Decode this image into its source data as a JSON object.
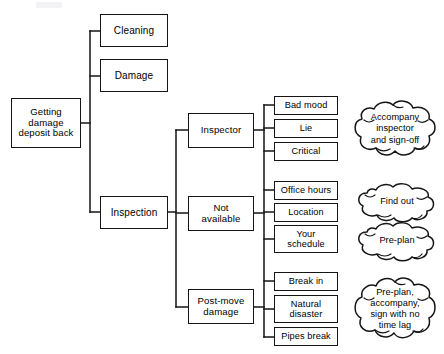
{
  "diagram": {
    "type": "tree-diagram",
    "title_visible": false,
    "background_color": "#ffffff",
    "line_color": "#151515",
    "text_color": "#000000",
    "root": {
      "label": "Getting\ndamage\ndeposit back",
      "x": 11,
      "y": 98,
      "w": 70,
      "h": 50,
      "font_size": 9.6
    },
    "level1": [
      {
        "label": "Cleaning",
        "x": 100,
        "y": 14,
        "w": 68,
        "h": 33,
        "font_size": 10
      },
      {
        "label": "Damage",
        "x": 100,
        "y": 59,
        "w": 68,
        "h": 33,
        "font_size": 10
      },
      {
        "label": "Inspection",
        "x": 100,
        "y": 196,
        "w": 68,
        "h": 33,
        "font_size": 10
      }
    ],
    "level2": [
      {
        "label": "Inspector",
        "x": 188,
        "y": 113,
        "w": 66,
        "h": 35,
        "font_size": 9.6
      },
      {
        "label": "Not\navailable",
        "x": 188,
        "y": 196,
        "w": 66,
        "h": 35,
        "font_size": 9.6
      },
      {
        "label": "Post-move\ndamage",
        "x": 188,
        "y": 289,
        "w": 66,
        "h": 35,
        "font_size": 9.6
      }
    ],
    "level3": [
      {
        "label": "Bad mood",
        "x": 274,
        "y": 96,
        "w": 64,
        "h": 19,
        "font_size": 9.2,
        "group": "inspector"
      },
      {
        "label": "Lie",
        "x": 274,
        "y": 119,
        "w": 64,
        "h": 19,
        "font_size": 9.2,
        "group": "inspector"
      },
      {
        "label": "Critical",
        "x": 274,
        "y": 142,
        "w": 64,
        "h": 19,
        "font_size": 9.2,
        "group": "inspector"
      },
      {
        "label": "Office hours",
        "x": 274,
        "y": 181,
        "w": 64,
        "h": 19,
        "font_size": 9.2,
        "group": "not-available"
      },
      {
        "label": "Location",
        "x": 274,
        "y": 203,
        "w": 64,
        "h": 19,
        "font_size": 9.2,
        "group": "not-available"
      },
      {
        "label": "Your\nschedule",
        "x": 274,
        "y": 225,
        "w": 64,
        "h": 28,
        "font_size": 9.2,
        "group": "not-available"
      },
      {
        "label": "Break in",
        "x": 274,
        "y": 272,
        "w": 64,
        "h": 19,
        "font_size": 9.2,
        "group": "post-move"
      },
      {
        "label": "Natural\ndisaster",
        "x": 274,
        "y": 295,
        "w": 64,
        "h": 28,
        "font_size": 9.2,
        "group": "post-move"
      },
      {
        "label": "Pipes break",
        "x": 274,
        "y": 327,
        "w": 64,
        "h": 19,
        "font_size": 9.2,
        "group": "post-move"
      }
    ],
    "clouds": [
      {
        "label": "Accompany\ninspector\nand sign-off",
        "x": 352,
        "y": 100,
        "w": 86,
        "h": 58,
        "font_size": 9.2,
        "relates_to": "inspector"
      },
      {
        "label": "Find out",
        "x": 356,
        "y": 182,
        "w": 82,
        "h": 40,
        "font_size": 9.2,
        "relates_to": "not-available-office-hours-location"
      },
      {
        "label": "Pre-plan",
        "x": 356,
        "y": 221,
        "w": 82,
        "h": 40,
        "font_size": 9.2,
        "relates_to": "not-available-your-schedule"
      },
      {
        "label": "Pre-plan,\naccompany,\nsign with no\ntime lag",
        "x": 352,
        "y": 276,
        "w": 86,
        "h": 66,
        "font_size": 9.2,
        "relates_to": "post-move"
      }
    ],
    "connectors": {
      "root_trunk_x": 90,
      "root_stub_y": 123,
      "level1_trunk_top": 31,
      "level1_trunk_bottom": 212,
      "level2_trunk_x": 176,
      "level2_trunk_top": 130,
      "level2_trunk_bottom": 306,
      "leaf_trunk_x": 264
    }
  }
}
